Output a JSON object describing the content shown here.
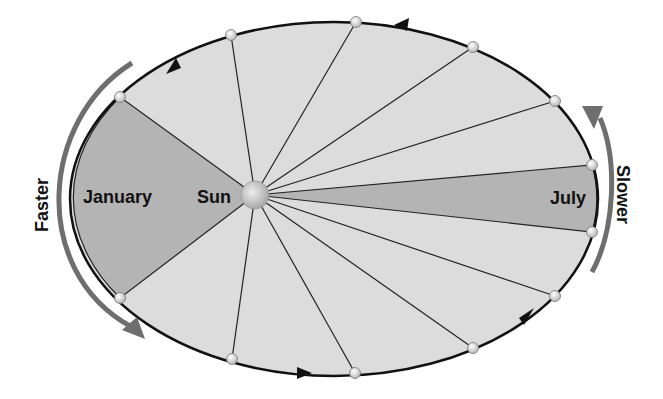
{
  "diagram": {
    "labels": {
      "sun": "Sun",
      "january": "January",
      "july": "July",
      "faster": "Faster",
      "slower": "Slower"
    },
    "colors": {
      "background": "#ffffff",
      "orbit_fill": "#dcdcdc",
      "wedge_fill": "#b4b4b4",
      "orbit_stroke": "#111111",
      "speed_arrow": "#6e6e6e",
      "sun_fill": "#c8c8c8",
      "planet_fill": "#e8e8e8"
    },
    "orbit": {
      "cx": 334,
      "cy": 199,
      "rx": 264,
      "ry": 177
    },
    "sun": {
      "x": 255,
      "y": 195,
      "r": 14
    },
    "planet_positions": [
      [
        120,
        97
      ],
      [
        231,
        35
      ],
      [
        356,
        22
      ],
      [
        473,
        47
      ],
      [
        555,
        101
      ],
      [
        592,
        165
      ],
      [
        592,
        232
      ],
      [
        555,
        296
      ],
      [
        473,
        348
      ],
      [
        355,
        373
      ],
      [
        232,
        359
      ],
      [
        120,
        298
      ]
    ],
    "shaded_wedges": [
      "january",
      "july"
    ],
    "direction": "counterclockwise"
  }
}
